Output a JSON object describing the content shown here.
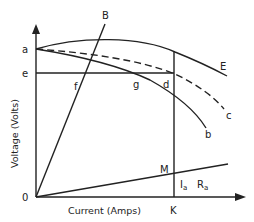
{
  "diagram": {
    "type": "generator characteristic curves",
    "axes": {
      "x_label": "Current (Amps)",
      "y_label": "Voltage (Volts)",
      "origin_label": "0"
    },
    "point_labels": {
      "a": "a",
      "e": "e",
      "f": "f",
      "g": "g",
      "d": "d",
      "M": "M",
      "K": "K"
    },
    "curve_labels": {
      "B": "B",
      "E": "E",
      "c": "c",
      "b": "b"
    },
    "drop_label": {
      "I": "I",
      "I_sub": "a",
      "R": "R",
      "R_sub": "a"
    },
    "colors": {
      "line": "#222222",
      "background": "#ffffff"
    }
  }
}
